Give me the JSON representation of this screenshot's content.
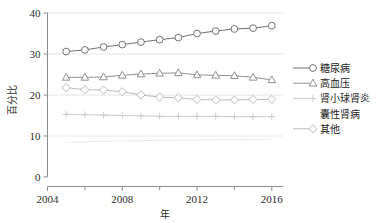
{
  "chart_data": {
    "type": "line",
    "title": "",
    "xlabel": "年",
    "ylabel": "百分比",
    "xlim": [
      2004,
      2016.6
    ],
    "ylim": [
      0,
      40
    ],
    "yticks": [
      0,
      10,
      20,
      30,
      40
    ],
    "ytick_labels": [
      "0",
      "10",
      "20",
      "30",
      "40"
    ],
    "xticks": [
      2004,
      2008,
      2012,
      2016
    ],
    "xtick_labels": [
      "2004",
      "2008",
      "2012",
      "2016"
    ],
    "xminor_ticks": [
      2006,
      2010,
      2014
    ],
    "grid": "horizontal",
    "legend_position": "right",
    "x": [
      2005,
      2006,
      2007,
      2008,
      2009,
      2010,
      2011,
      2012,
      2013,
      2014,
      2015,
      2016
    ],
    "series": [
      {
        "name": "糖尿病",
        "marker": "circle",
        "color": "#6f7175",
        "values": [
          30.6,
          31.0,
          31.7,
          32.3,
          32.9,
          33.5,
          34.0,
          35.0,
          35.6,
          36.1,
          36.3,
          36.9
        ]
      },
      {
        "name": "高血压",
        "marker": "triangle",
        "color": "#8d9196",
        "values": [
          24.3,
          24.3,
          24.4,
          24.8,
          25.1,
          25.3,
          25.4,
          24.9,
          24.8,
          24.7,
          24.3,
          23.7
        ]
      },
      {
        "name": "肾小球肾炎",
        "marker": "plus",
        "color": "#c9cbcf",
        "values": [
          15.3,
          15.2,
          15.1,
          15.0,
          14.9,
          14.8,
          14.8,
          14.8,
          14.8,
          14.7,
          14.7,
          14.7
        ]
      },
      {
        "name": "囊性肾病",
        "marker": "none",
        "color": "#e9eaec",
        "values": [
          8.5,
          8.6,
          8.7,
          8.8,
          8.9,
          8.9,
          9.0,
          9.0,
          9.1,
          9.1,
          9.2,
          9.2
        ]
      },
      {
        "name": "其他",
        "marker": "diamond",
        "color": "#b7babe",
        "values": [
          21.8,
          21.3,
          21.2,
          20.8,
          20.0,
          19.5,
          19.3,
          18.9,
          18.8,
          18.8,
          18.9,
          18.9
        ]
      }
    ]
  },
  "legend": {
    "items": [
      {
        "label": "糖尿病",
        "marker": "circle"
      },
      {
        "label": "高血压",
        "marker": "triangle"
      },
      {
        "label": "肾小球肾炎",
        "marker": "plus"
      },
      {
        "label": "囊性肾病",
        "marker": "none"
      },
      {
        "label": "其他",
        "marker": "diamond"
      }
    ]
  },
  "axes": {
    "y_title": "百分比",
    "x_title": "年"
  }
}
